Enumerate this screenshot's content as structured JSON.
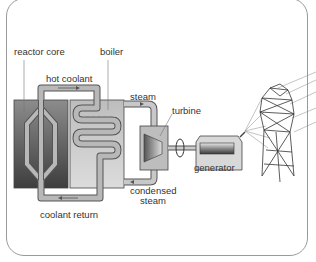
{
  "diagram": {
    "type": "nuclear power plant schematic",
    "labels": {
      "reactor_core": "reactor core",
      "boiler": "boiler",
      "hot_coolant": "hot coolant",
      "steam": "steam",
      "turbine": "turbine",
      "generator": "generator",
      "condensed_steam_line1": "condensed",
      "condensed_steam_line2": "steam",
      "coolant_return": "coolant return"
    },
    "colors": {
      "reactor_dark": "#3e3e3e",
      "reactor_light": "#8c8c8c",
      "boiler_fill": "#c8c8c8",
      "pipe_fill": "#b4b4b4",
      "pipe_outline": "#555555",
      "frame": "#9a9a9a"
    }
  }
}
